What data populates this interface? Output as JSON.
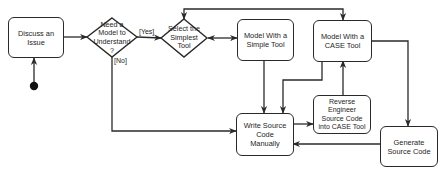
{
  "diagram": {
    "type": "UML activity diagram",
    "initial_node": {
      "label": ""
    },
    "nodes": {
      "discuss": {
        "label": "Discuss an Issue",
        "kind": "action"
      },
      "need_model": {
        "label": "Need a Model to Understand ?",
        "kind": "decision"
      },
      "select_tool": {
        "label": "Select the Simplest Tool",
        "kind": "decision"
      },
      "simple_tool": {
        "label": "Model With a Simple Tool",
        "kind": "action"
      },
      "case_tool": {
        "label": "Model With a CASE Tool",
        "kind": "action"
      },
      "write_code": {
        "label": "Write Source Code Manually",
        "kind": "action"
      },
      "reverse_engineer": {
        "label": "Reverse Engineer Source Code into CASE Tool",
        "kind": "action"
      },
      "generate_code": {
        "label": "Generate Source Code",
        "kind": "action"
      }
    },
    "guards": {
      "yes": "[Yes]",
      "no": "[No]"
    },
    "edges": [
      {
        "from": "initial",
        "to": "discuss"
      },
      {
        "from": "discuss",
        "to": "need_model"
      },
      {
        "from": "need_model",
        "to": "select_tool",
        "guard": "[Yes]"
      },
      {
        "from": "need_model",
        "to": "write_code",
        "guard": "[No]"
      },
      {
        "from": "select_tool",
        "to": "simple_tool",
        "bidirectional": true
      },
      {
        "from": "select_tool",
        "to": "case_tool",
        "bidirectional": true
      },
      {
        "from": "simple_tool",
        "to": "write_code"
      },
      {
        "from": "case_tool",
        "to": "write_code"
      },
      {
        "from": "case_tool",
        "to": "generate_code"
      },
      {
        "from": "write_code",
        "to": "reverse_engineer"
      },
      {
        "from": "reverse_engineer",
        "to": "case_tool"
      },
      {
        "from": "generate_code",
        "to": "write_code"
      }
    ],
    "colors": {
      "stroke": "#2a2a2a",
      "fill": "#ffffff",
      "text": "#1e1e1e"
    }
  }
}
